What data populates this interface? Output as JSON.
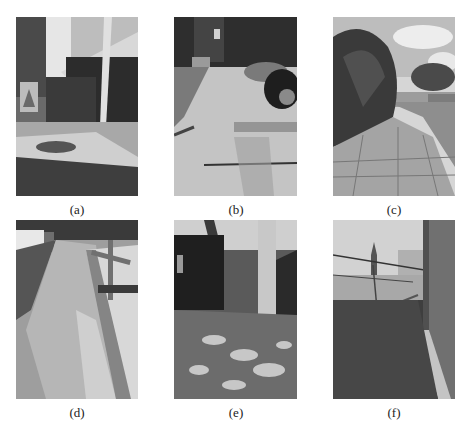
{
  "figure": {
    "panels": [
      {
        "label": "(a)",
        "description": "Sidewalk with scooters parked, pole, caution sign, dappled shade"
      },
      {
        "label": "(b)",
        "description": "Wide sidewalk with cars parked on pavement, tactile strip"
      },
      {
        "label": "(c)",
        "description": "Tiled sidewalk narrowed by overgrown bushes, road on right"
      },
      {
        "label": "(d)",
        "description": "Sidewalk with curb and tree planters, parked cars on left"
      },
      {
        "label": "(e)",
        "description": "Car parked on sidewalk near pillar, shaded pavement"
      },
      {
        "label": "(f)",
        "description": "Sidewalk next to construction site with metal bars and fences"
      }
    ]
  }
}
